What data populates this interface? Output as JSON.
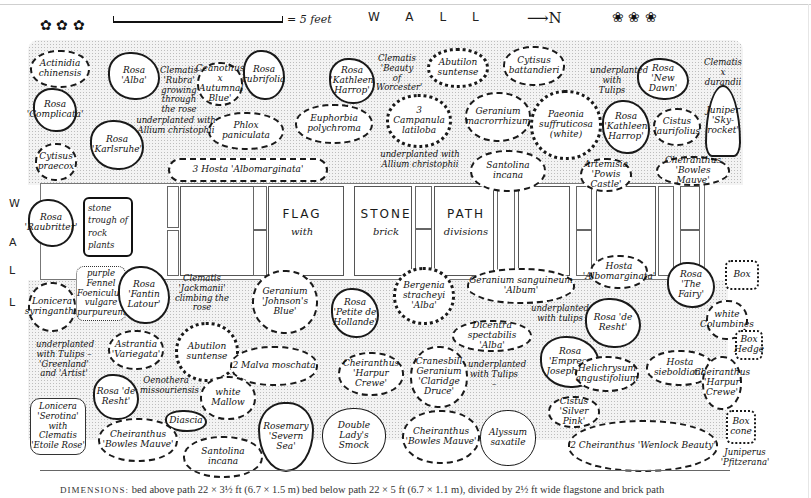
{
  "title": {
    "wall_top": "WALL",
    "wall_left": [
      "W",
      "A",
      "L",
      "L"
    ],
    "scale_label": "= 5 feet",
    "north_label": "N",
    "north_arrow": "arrow-right-icon"
  },
  "path": {
    "words": [
      "FLAG",
      "STONE",
      "PATH"
    ],
    "subwords": [
      "with",
      "brick",
      "divisions"
    ],
    "trough": "stone trough of rock plants"
  },
  "bed_above": {
    "plants": [
      {
        "id": "actinidia",
        "label": "Actinidia chinensis"
      },
      {
        "id": "rosa-alba",
        "label": "Rosa 'Alba'"
      },
      {
        "id": "clematis-rubra",
        "label": "Clematis 'Rubra' growing through the rose"
      },
      {
        "id": "ceanothus",
        "label": "Ceanothus x 'Autumnal Blue'"
      },
      {
        "id": "rosa-rubrifolia",
        "label": "Rosa rubrifolia"
      },
      {
        "id": "rosa-kathleen-1",
        "label": "Rosa 'Kathleen Harrop'"
      },
      {
        "id": "clematis-worcester",
        "label": "Clematis 'Beauty of Worcester'"
      },
      {
        "id": "abutilon-1",
        "label": "Abutilon suntense"
      },
      {
        "id": "cytisus-batt",
        "label": "Cytisus battandieri"
      },
      {
        "id": "rosa-new-dawn",
        "label": "Rosa 'New Dawn'"
      },
      {
        "id": "clematis-durandii",
        "label": "Clematis x durandii"
      },
      {
        "id": "rosa-complicata",
        "label": "Rosa 'Complicata'"
      },
      {
        "id": "rosa-karlsruhe",
        "label": "Rosa 'Karlsruhe'"
      },
      {
        "id": "cytisus-praecox",
        "label": "Cytisus praecox"
      },
      {
        "id": "phlox",
        "label": "Phlox paniculata"
      },
      {
        "id": "euphorbia",
        "label": "Euphorbia polychroma"
      },
      {
        "id": "campanula",
        "label": "3 Campanula latiloba"
      },
      {
        "id": "geranium-macro",
        "label": "Geranium macrorrhizum"
      },
      {
        "id": "paeonia",
        "label": "Paeonia suffruticosa (white)"
      },
      {
        "id": "rosa-kathleen-2",
        "label": "Rosa 'Kathleen Harrop'"
      },
      {
        "id": "cistus-laur",
        "label": "Cistus laurifolius"
      },
      {
        "id": "juniper-sky",
        "label": "Juniper 'Sky-rocket'"
      },
      {
        "id": "hosta-albo-1",
        "label": "3 Hosta 'Albomarginata'"
      },
      {
        "id": "santolina-1",
        "label": "Santolina incana"
      },
      {
        "id": "artemisia",
        "label": "Artemisia 'Powis Castle'"
      },
      {
        "id": "cheiranthus-bowles-1",
        "label": "Cheiranthus 'Bowles Mauve'"
      }
    ],
    "notes": [
      {
        "id": "under-allium-1",
        "text": "underplanted with Allium christophii"
      },
      {
        "id": "under-allium-2",
        "text": "underplanted with Allium christophii"
      },
      {
        "id": "under-tulips-top",
        "text": "underplanted with Tulips"
      }
    ]
  },
  "bed_below": {
    "plants": [
      {
        "id": "rosa-rau",
        "label": "Rosa 'Raubritter'"
      },
      {
        "id": "lonicera-syr",
        "label": "Lonicera syringantha"
      },
      {
        "id": "fennel",
        "label": "purple Fennel Foeniculum vulgare purpureum"
      },
      {
        "id": "rosa-fantin",
        "label": "Rosa 'Fantin Latour'"
      },
      {
        "id": "clematis-jack",
        "label": "Clematis 'Jackmanii' climbing the rose"
      },
      {
        "id": "geranium-johnson",
        "label": "Geranium 'Johnson's Blue'"
      },
      {
        "id": "rosa-petite",
        "label": "Rosa 'Petite de Hollande'"
      },
      {
        "id": "bergenia",
        "label": "Bergenia stracheyi 'Alba'"
      },
      {
        "id": "geranium-sang",
        "label": "Geranium sanguineum 'Album'"
      },
      {
        "id": "hosta-albo-2",
        "label": "Hosta 'Albomarginata'"
      },
      {
        "id": "rosa-fairy",
        "label": "Rosa 'The Fairy'"
      },
      {
        "id": "box-1",
        "label": "Box"
      },
      {
        "id": "columbines",
        "label": "white Columbines"
      },
      {
        "id": "astrantia",
        "label": "Astrantia 'Variegata'"
      },
      {
        "id": "abutilon-2",
        "label": "Abutilon suntense"
      },
      {
        "id": "malva",
        "label": "2 Malva moschata"
      },
      {
        "id": "dicentra",
        "label": "Dicentra spectabilis 'Alba'"
      },
      {
        "id": "rosa-de-resht-1",
        "label": "Rosa 'de Resht'"
      },
      {
        "id": "box-hedge",
        "label": "Box Hedge"
      },
      {
        "id": "rosa-de-resht-2",
        "label": "Rosa 'de Resht'"
      },
      {
        "id": "oenothera",
        "label": "Oenothera missouriensis"
      },
      {
        "id": "white-mallow",
        "label": "white Mallow"
      },
      {
        "id": "cheiranthus-harpur-1",
        "label": "Cheiranthus 'Harpur Crewe'"
      },
      {
        "id": "cranesbill",
        "label": "Cranesbill Geranium 'Claridge Druce'"
      },
      {
        "id": "rosa-empress",
        "label": "Rosa 'Empress Josephine'"
      },
      {
        "id": "helichrysum",
        "label": "Helichrysum angustifolium"
      },
      {
        "id": "hosta-sieb",
        "label": "Hosta sieboldiana"
      },
      {
        "id": "cheiranthus-harpur-2",
        "label": "Cheiranthus 'Harpur Crewe'"
      },
      {
        "id": "lonicera-ser",
        "label": "Lonicera 'Serotina' with Clematis 'Etoile Rose'"
      },
      {
        "id": "diascia",
        "label": "Diascia"
      },
      {
        "id": "cheiranthus-bowles-2",
        "label": "Cheiranthus 'Bowles Mauve'"
      },
      {
        "id": "santolina-2",
        "label": "Santolina incana"
      },
      {
        "id": "rosemary",
        "label": "Rosemary 'Severn Sea'"
      },
      {
        "id": "ladys-smock",
        "label": "Double Lady's Smock"
      },
      {
        "id": "cheiranthus-bowles-3",
        "label": "Cheiranthus 'Bowles Mauve'"
      },
      {
        "id": "alyssum",
        "label": "Alyssum saxatile"
      },
      {
        "id": "cistus-silver",
        "label": "Cistus 'Silver Pink'"
      },
      {
        "id": "cheiranthus-wenlock",
        "label": "2 Cheiranthus 'Wenlock Beauty'"
      },
      {
        "id": "box-cone",
        "label": "Box cone"
      },
      {
        "id": "juniperus",
        "label": "Juniperus 'Pfitzerana'"
      }
    ],
    "notes": [
      {
        "id": "under-tulips-gr",
        "text": "underplanted with Tulips – 'Greenland' and 'Artist'"
      },
      {
        "id": "under-tulips-mid",
        "text": "underplanted with tulips"
      },
      {
        "id": "under-tulips-low",
        "text": "underplanted with Tulips –"
      }
    ]
  },
  "caption": {
    "lead": "DIMENSIONS:",
    "text": " bed above path 22 × 3½ ft (6.7 × 1.5 m) bed below path 22 × 5 ft (6.7 × 1.1 m), divided by 2½ ft wide flagstone and brick path"
  }
}
